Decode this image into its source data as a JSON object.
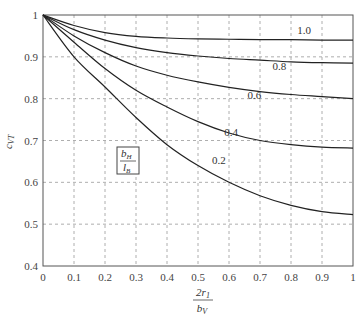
{
  "chart_data": {
    "type": "line",
    "title": "",
    "xlabel": "2r1 / bV",
    "xlabel_num": "2r",
    "xlabel_num_sub": "1",
    "xlabel_den": "b",
    "xlabel_den_sub": "V",
    "ylabel": "cVT",
    "ylabel_main": "c",
    "ylabel_sub": "VT",
    "xlim": [
      0,
      1
    ],
    "ylim": [
      0.4,
      1
    ],
    "grid": true,
    "x_ticks": [
      "0",
      "0.1",
      "0.2",
      "0.3",
      "0.4",
      "0.5",
      "0.6",
      "0.7",
      "0.8",
      "0.9",
      "1"
    ],
    "y_ticks": [
      "0.4",
      "0.5",
      "0.6",
      "0.7",
      "0.8",
      "0.9",
      "1"
    ],
    "legend": {
      "title_num": "b",
      "title_num_sub": "H",
      "title_den": "l",
      "title_den_sub": "B",
      "position": "inside-left"
    },
    "x": [
      0,
      0.1,
      0.2,
      0.3,
      0.4,
      0.5,
      0.6,
      0.7,
      0.8,
      0.9,
      1.0
    ],
    "series": [
      {
        "name": "1.0",
        "values": [
          1,
          0.975,
          0.958,
          0.949,
          0.945,
          0.943,
          0.942,
          0.941,
          0.941,
          0.94,
          0.94
        ],
        "label_x": 0.82,
        "label_y": 0.955
      },
      {
        "name": "0.8",
        "values": [
          1,
          0.965,
          0.94,
          0.922,
          0.91,
          0.902,
          0.896,
          0.892,
          0.888,
          0.886,
          0.885
        ],
        "label_x": 0.74,
        "label_y": 0.868
      },
      {
        "name": "0.6",
        "values": [
          1,
          0.95,
          0.91,
          0.878,
          0.856,
          0.84,
          0.827,
          0.817,
          0.81,
          0.805,
          0.8
        ],
        "label_x": 0.66,
        "label_y": 0.8
      },
      {
        "name": "0.4",
        "values": [
          1,
          0.935,
          0.872,
          0.82,
          0.78,
          0.745,
          0.718,
          0.7,
          0.69,
          0.684,
          0.682
        ],
        "label_x": 0.585,
        "label_y": 0.71
      },
      {
        "name": "0.2",
        "values": [
          1,
          0.9,
          0.828,
          0.755,
          0.69,
          0.64,
          0.6,
          0.568,
          0.545,
          0.53,
          0.523
        ],
        "label_x": 0.545,
        "label_y": 0.645
      }
    ]
  }
}
